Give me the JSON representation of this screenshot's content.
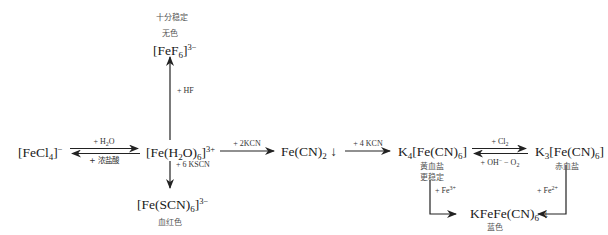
{
  "diagram": {
    "nodes": {
      "fecl4": {
        "prefix": "[FeCl",
        "sub": "4",
        "suffix": "]",
        "sup": "−"
      },
      "feh2o": {
        "p1": "[Fe(H",
        "s1": "2",
        "p2": "O)",
        "s2": "6",
        "p3": "]",
        "sup": "3+"
      },
      "fef6": {
        "prefix": "[FeF",
        "sub": "6",
        "suffix": "]",
        "sup": "3−",
        "note1": "十分稳定",
        "note2": "无色"
      },
      "fescn": {
        "prefix": "[Fe(SCN)",
        "sub": "6",
        "suffix": "]",
        "sup": "3−",
        "note": "血红色"
      },
      "fecn2": {
        "prefix": "Fe(CN)",
        "sub": "2",
        "suffix": " ↓"
      },
      "k4": {
        "p1": "K",
        "s1": "4",
        "p2": "[Fe(CN)",
        "s2": "6",
        "p3": "]",
        "note1": "黄血盐",
        "note2": "更稳定"
      },
      "k3": {
        "p1": "K",
        "s1": "3",
        "p2": "[Fe(CN)",
        "s2": "6",
        "p3": "]",
        "note": "赤血盐"
      },
      "prussian": {
        "prefix": "KFeFe(CN)",
        "sub": "6",
        "suffix": " ↓",
        "note": "蓝色"
      }
    },
    "reactions": {
      "fecl4_to_feh2o": {
        "p": "+ H",
        "sub": "2",
        "s": "O"
      },
      "feh2o_to_fecl4": "+ 浓盐酸",
      "feh2o_to_fef6": "+ HF",
      "feh2o_to_fescn": "+ 6 KSCN",
      "feh2o_to_fecn2": "+ 2KCN",
      "fecn2_to_k4": "+ 4 KCN",
      "k4_to_k3": {
        "p": "+ Cl",
        "sub": "2"
      },
      "k3_to_k4": {
        "p": "+ OH",
        "sup": "−",
        "m": " − O",
        "sub": "2"
      },
      "k4_to_prussian": {
        "p": "+ Fe",
        "sup": "3+"
      },
      "k3_to_prussian": {
        "p": "+ Fe",
        "sup": "2+"
      }
    }
  }
}
